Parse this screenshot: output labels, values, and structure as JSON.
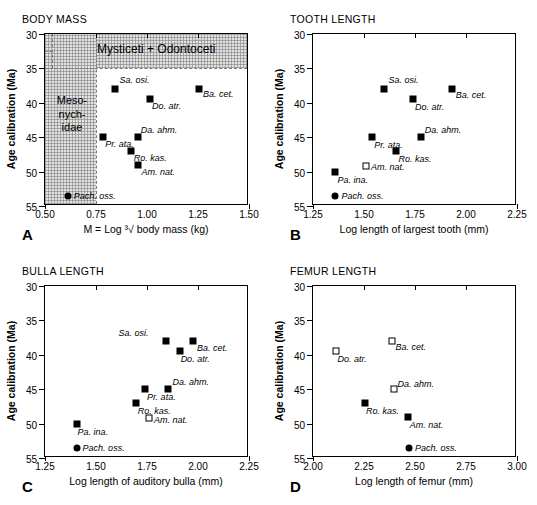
{
  "figure": {
    "panels": [
      {
        "letter": "A",
        "title": "BODY MASS",
        "xlabel": "M  =  Log ³√ body mass (kg)",
        "ylabel": "Age calibration (Ma)",
        "xticks": [
          "0.50",
          "0.75",
          "1.00",
          "1.25",
          "1.50"
        ],
        "yticks": [
          "30",
          "35",
          "40",
          "45",
          "50",
          "55"
        ],
        "regions": [
          {
            "label": "Mysticeti + Odontoceti"
          },
          {
            "label": "Meso-\nnych-\nidae"
          }
        ]
      },
      {
        "letter": "B",
        "title": "TOOTH LENGTH",
        "xlabel": "Log length of largest tooth (mm)",
        "ylabel": "Age calibration (Ma)",
        "xticks": [
          "1.25",
          "1.50",
          "1.75",
          "2.00",
          "2.25"
        ],
        "yticks": [
          "30",
          "35",
          "40",
          "45",
          "50",
          "55"
        ]
      },
      {
        "letter": "C",
        "title": "BULLA LENGTH",
        "xlabel": "Log length of auditory bulla (mm)",
        "ylabel": "Age calibration (Ma)",
        "xticks": [
          "1.25",
          "1.50",
          "1.75",
          "2.00",
          "2.25"
        ],
        "yticks": [
          "30",
          "35",
          "40",
          "45",
          "50",
          "55"
        ]
      },
      {
        "letter": "D",
        "title": "FEMUR LENGTH",
        "xlabel": "Log length of femur (mm)",
        "ylabel": "Age calibration (Ma)",
        "xticks": [
          "2.00",
          "2.25",
          "2.50",
          "2.75",
          "3.00"
        ],
        "yticks": [
          "30",
          "35",
          "40",
          "45",
          "50",
          "55"
        ]
      }
    ]
  },
  "chart_data": [
    {
      "type": "scatter",
      "panel": "A",
      "title": "BODY MASS",
      "xlabel": "M = Log ³√ body mass (kg)",
      "ylabel": "Age calibration (Ma)",
      "xlim": [
        0.5,
        1.5
      ],
      "ylim": [
        55,
        30
      ],
      "xticks": [
        0.5,
        0.75,
        1.0,
        1.25,
        1.5
      ],
      "yticks": [
        30,
        35,
        40,
        45,
        50,
        55
      ],
      "grid": false,
      "legend": "none",
      "annotations": [
        {
          "text": "Mysticeti + Odontoceti",
          "x": 1.05,
          "y": 32.5
        },
        {
          "text": "Mesonychidae",
          "x": 0.645,
          "y": 42.5
        }
      ],
      "shaded_regions": [
        {
          "name": "Mysticeti + Odontoceti",
          "x_range": [
            0.5,
            1.5
          ],
          "y_range": [
            30,
            35
          ]
        },
        {
          "name": "Mesonychidae",
          "x_range": [
            0.5,
            0.75
          ],
          "y_range": [
            30,
            55
          ]
        }
      ],
      "points": [
        {
          "label": "Sa. osi.",
          "x": 0.845,
          "y": 38.0,
          "marker": "filled-square"
        },
        {
          "label": "Ba. cet.",
          "x": 1.255,
          "y": 38.0,
          "marker": "filled-square"
        },
        {
          "label": "Do. atr.",
          "x": 1.015,
          "y": 39.5,
          "marker": "filled-square"
        },
        {
          "label": "Da. ahm.",
          "x": 0.955,
          "y": 45.0,
          "marker": "filled-square"
        },
        {
          "label": "Pr. ata.",
          "x": 0.785,
          "y": 45.0,
          "marker": "filled-square"
        },
        {
          "label": "Ro. kas.",
          "x": 0.92,
          "y": 47.0,
          "marker": "filled-square"
        },
        {
          "label": "Am. nat.",
          "x": 0.958,
          "y": 49.0,
          "marker": "filled-square"
        },
        {
          "label": "Pach. oss.",
          "x": 0.612,
          "y": 53.5,
          "marker": "filled-circle"
        }
      ]
    },
    {
      "type": "scatter",
      "panel": "B",
      "title": "TOOTH LENGTH",
      "xlabel": "Log length of largest tooth (mm)",
      "ylabel": "Age calibration (Ma)",
      "xlim": [
        1.25,
        2.25
      ],
      "ylim": [
        55,
        30
      ],
      "xticks": [
        1.25,
        1.5,
        1.75,
        2.0,
        2.25
      ],
      "yticks": [
        30,
        35,
        40,
        45,
        50,
        55
      ],
      "grid": false,
      "legend": "none",
      "points": [
        {
          "label": "Sa. osi.",
          "x": 1.6,
          "y": 38.0,
          "marker": "filled-square"
        },
        {
          "label": "Ba. cet.",
          "x": 1.93,
          "y": 38.0,
          "marker": "filled-square"
        },
        {
          "label": "Do. atr.",
          "x": 1.74,
          "y": 39.5,
          "marker": "filled-square"
        },
        {
          "label": "Da. ahm.",
          "x": 1.778,
          "y": 45.0,
          "marker": "filled-square"
        },
        {
          "label": "Pr. ata.",
          "x": 1.54,
          "y": 45.0,
          "marker": "filled-square"
        },
        {
          "label": "Ro. kas.",
          "x": 1.655,
          "y": 47.0,
          "marker": "filled-square"
        },
        {
          "label": "Am. nat.",
          "x": 1.51,
          "y": 49.2,
          "marker": "open-square"
        },
        {
          "label": "Pa. ina.",
          "x": 1.36,
          "y": 50.0,
          "marker": "filled-square"
        },
        {
          "label": "Pach. oss.",
          "x": 1.36,
          "y": 53.5,
          "marker": "filled-circle"
        }
      ]
    },
    {
      "type": "scatter",
      "panel": "C",
      "title": "BULLA LENGTH",
      "xlabel": "Log length of auditory bulla (mm)",
      "ylabel": "Age calibration (Ma)",
      "xlim": [
        1.25,
        2.25
      ],
      "ylim": [
        55,
        30
      ],
      "xticks": [
        1.25,
        1.5,
        1.75,
        2.0,
        2.25
      ],
      "yticks": [
        30,
        35,
        40,
        45,
        50,
        55
      ],
      "grid": false,
      "legend": "none",
      "points": [
        {
          "label": "Sa. osi.",
          "x": 1.845,
          "y": 38.0,
          "marker": "filled-square"
        },
        {
          "label": "Ba. cet.",
          "x": 1.975,
          "y": 38.0,
          "marker": "filled-square"
        },
        {
          "label": "Do. atr.",
          "x": 1.91,
          "y": 39.5,
          "marker": "filled-square"
        },
        {
          "label": "Da. ahm.",
          "x": 1.855,
          "y": 45.0,
          "marker": "filled-square"
        },
        {
          "label": "Pr. ata.",
          "x": 1.74,
          "y": 45.0,
          "marker": "filled-square"
        },
        {
          "label": "Ro. kas.",
          "x": 1.695,
          "y": 47.0,
          "marker": "filled-square"
        },
        {
          "label": "Am. nat.",
          "x": 1.76,
          "y": 49.2,
          "marker": "open-square"
        },
        {
          "label": "Pa. ina.",
          "x": 1.405,
          "y": 50.0,
          "marker": "filled-square"
        },
        {
          "label": "Pach. oss.",
          "x": 1.405,
          "y": 53.5,
          "marker": "filled-circle"
        }
      ]
    },
    {
      "type": "scatter",
      "panel": "D",
      "title": "FEMUR LENGTH",
      "xlabel": "Log length of femur (mm)",
      "ylabel": "Age calibration (Ma)",
      "xlim": [
        2.0,
        3.0
      ],
      "ylim": [
        55,
        30
      ],
      "xticks": [
        2.0,
        2.25,
        2.5,
        2.75,
        3.0
      ],
      "yticks": [
        30,
        35,
        40,
        45,
        50,
        55
      ],
      "grid": false,
      "legend": "none",
      "points": [
        {
          "label": "Ba. cet.",
          "x": 2.385,
          "y": 38.0,
          "marker": "open-square"
        },
        {
          "label": "Do. atr.",
          "x": 2.115,
          "y": 39.5,
          "marker": "open-square"
        },
        {
          "label": "Da. ahm.",
          "x": 2.395,
          "y": 45.0,
          "marker": "open-square"
        },
        {
          "label": "Ro. kas.",
          "x": 2.255,
          "y": 47.0,
          "marker": "filled-square"
        },
        {
          "label": "Am. nat.",
          "x": 2.465,
          "y": 49.0,
          "marker": "filled-square"
        },
        {
          "label": "Pach. oss.",
          "x": 2.47,
          "y": 53.5,
          "marker": "filled-circle"
        }
      ]
    }
  ]
}
